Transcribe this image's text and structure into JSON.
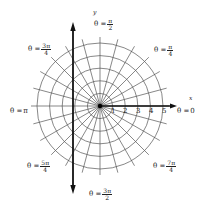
{
  "diagram": {
    "pole": {
      "x": 100,
      "y": 106
    },
    "unit_px": 12.6,
    "circle_radii": [
      1,
      2,
      3,
      4,
      5
    ],
    "ray_count": 24,
    "colors": {
      "grid": "#555555",
      "axis": "#111111",
      "pole": "#000000",
      "background": "#ffffff"
    },
    "axes": {
      "x_label": "x",
      "y_label": "y"
    },
    "ticks": [
      "1",
      "2",
      "3",
      "4",
      "5"
    ],
    "angle_labels": {
      "zero": {
        "prefix": "θ =",
        "value": "0"
      },
      "pi_over_4": {
        "prefix": "θ =",
        "num": "π",
        "den": "4"
      },
      "pi_over_2": {
        "prefix": "θ =",
        "num": "π",
        "den": "2"
      },
      "three_pi_over_4": {
        "prefix": "θ =",
        "num": "3π",
        "den": "4"
      },
      "pi": {
        "prefix": "θ =",
        "value": "π"
      },
      "five_pi_over_4": {
        "prefix": "θ =",
        "num": "5π",
        "den": "4"
      },
      "three_pi_over_2": {
        "prefix": "θ =",
        "num": "3π",
        "den": "2"
      },
      "seven_pi_over_4": {
        "prefix": "θ =",
        "num": "7π",
        "den": "4"
      }
    }
  }
}
